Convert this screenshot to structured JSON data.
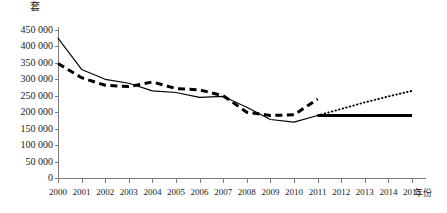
{
  "chart_data": {
    "type": "line",
    "title": "",
    "ylabel": "套",
    "xlabel": "年份",
    "grid": false,
    "legend": "none",
    "x": [
      2000,
      2001,
      2002,
      2003,
      2004,
      2005,
      2006,
      2007,
      2008,
      2009,
      2010,
      2011,
      2012,
      2013,
      2014,
      2015
    ],
    "xtick_labels": [
      "2000",
      "2001",
      "2002",
      "2003",
      "2004",
      "2005",
      "2006",
      "2007",
      "2008",
      "2009",
      "2010",
      "2011",
      "2012",
      "2013",
      "2014",
      "2015"
    ],
    "ylim": [
      0,
      450000
    ],
    "ytick_values": [
      0,
      50000,
      100000,
      150000,
      200000,
      250000,
      300000,
      350000,
      400000,
      450000
    ],
    "ytick_labels": [
      "0",
      "50 000",
      "100 000",
      "150 000",
      "200 000",
      "250 000",
      "300 000",
      "350 000",
      "400 000",
      "450 000"
    ],
    "series": [
      {
        "name": "thin-solid-historical",
        "style": "solid-thin",
        "color": "#000000",
        "x": [
          2000,
          2001,
          2002,
          2003,
          2004,
          2005,
          2006,
          2007,
          2008,
          2009,
          2010,
          2011
        ],
        "values": [
          425000,
          330000,
          300000,
          288000,
          265000,
          260000,
          245000,
          248000,
          215000,
          178000,
          170000,
          190000
        ]
      },
      {
        "name": "thick-dashed-historical",
        "style": "dashed-thick",
        "color": "#000000",
        "x": [
          2000,
          2001,
          2002,
          2003,
          2004,
          2005,
          2006,
          2007,
          2008,
          2009,
          2010,
          2011
        ],
        "values": [
          348000,
          305000,
          282000,
          278000,
          292000,
          272000,
          268000,
          250000,
          200000,
          190000,
          192000,
          240000
        ]
      },
      {
        "name": "thick-solid-projection",
        "style": "solid-thick",
        "color": "#000000",
        "x": [
          2011,
          2012,
          2013,
          2014,
          2015
        ],
        "values": [
          190000,
          190000,
          190000,
          190000,
          190000
        ]
      },
      {
        "name": "dotted-projection",
        "style": "dotted",
        "color": "#000000",
        "x": [
          2011,
          2012,
          2013,
          2014,
          2015
        ],
        "values": [
          190000,
          210000,
          230000,
          248000,
          265000
        ]
      }
    ]
  },
  "axes": {
    "y_unit_label": "套",
    "x_unit_label": "年份"
  }
}
